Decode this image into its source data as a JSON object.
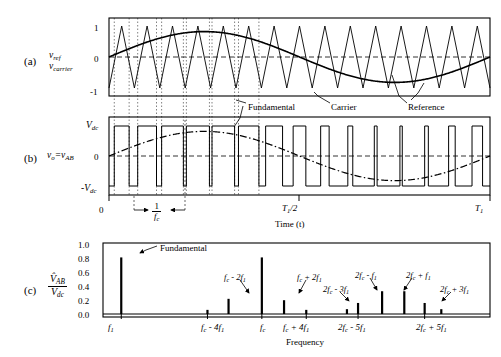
{
  "figure": {
    "panels": [
      "(a)",
      "(b)",
      "(c)"
    ]
  },
  "panel_a": {
    "tag": "(a)",
    "ylabel_line1": "v",
    "ylabel_line1_sub": "ref",
    "ylabel_line2": "v",
    "ylabel_line2_sub": "carrier",
    "yticks": [
      "1",
      "0",
      "-1"
    ],
    "annotations": [
      {
        "name": "carrier",
        "label": "Carrier"
      },
      {
        "name": "reference",
        "label": "Reference"
      }
    ]
  },
  "panel_b": {
    "tag": "(b)",
    "ylabel": "v",
    "ylabel_sub": "o",
    "ylabel_eq": "=v",
    "ylabel_eq_sub": "AB",
    "yticks": [
      "V",
      "0",
      "-V"
    ],
    "ytick_top": "V",
    "ytick_top_sub": "dc",
    "ytick_mid": "0",
    "ytick_bot": "-V",
    "ytick_bot_sub": "dc",
    "xticks": [
      {
        "label": "0",
        "italic": false
      },
      {
        "label": "T",
        "sub": "1",
        "suffix": "/2",
        "italic": true
      },
      {
        "label": "T",
        "sub": "1",
        "suffix": "",
        "italic": true
      }
    ],
    "xlabel": "Time  (t)",
    "period_marker_num": "1",
    "period_marker_den": "f",
    "period_marker_den_sub": "c",
    "annotations": [
      {
        "name": "fundamental",
        "label": "Fundamental"
      }
    ]
  },
  "panel_c": {
    "tag": "(c)",
    "ylabel_num": "V",
    "ylabel_num_sub": "AB",
    "ylabel_num_hat": "^",
    "ylabel_den": "V",
    "ylabel_den_sub": "dc",
    "yticks": [
      "1.0",
      "0.8",
      "0.6",
      "0.4",
      "0.2",
      "0.0"
    ],
    "xlabel": "Frequency",
    "annotation_fundamental": "Fundamental"
  },
  "chart_data": {
    "type": "bar",
    "ylabel": "V_AB_hat / V_dc",
    "xlabel": "Frequency",
    "ylim": [
      0.0,
      1.0
    ],
    "yticks": [
      0.0,
      0.2,
      0.4,
      0.6,
      0.8,
      1.0
    ],
    "grid": false,
    "legend": "none",
    "categories": [
      "f1",
      "fc - 4f1",
      "fc - 2f1",
      "fc",
      "fc + 2f1",
      "fc + 4f1",
      "2fc - 5f1",
      "2fc - 3f1",
      "2fc - f1",
      "2fc + f1",
      "2fc + 3f1",
      "2fc + 5f1"
    ],
    "category_labels": [
      "f₁",
      "fᶜ - 4f₁",
      "fᶜ - 2f₁",
      "fᶜ",
      "fᶜ + 2f₁",
      "fᶜ + 4f₁",
      "2fᶜ - 5f₁",
      "2fᶜ - 3f₁",
      "2fᶜ - f₁",
      "2fᶜ + f₁",
      "2fᶜ + 3f₁",
      "2fᶜ + 5f₁"
    ],
    "values": [
      0.82,
      0.06,
      0.22,
      0.82,
      0.2,
      0.06,
      0.07,
      0.16,
      0.33,
      0.33,
      0.16,
      0.07
    ],
    "x_axis_tick_labels": [
      {
        "text": "f",
        "sub": "1",
        "pos": 0.0
      },
      {
        "text": "f",
        "sub": "c",
        "prefix": "",
        "suffix": " - 4f",
        "sub2": "1",
        "pos": 0.44
      },
      {
        "text": "f",
        "sub": "c",
        "pos": 0.55
      },
      {
        "text": "f",
        "sub": "c",
        "suffix": " + 4f",
        "sub2": "1",
        "pos": 0.66
      },
      {
        "text": "2f",
        "sub": "c",
        "suffix": " - 5f",
        "sub2": "1",
        "pos": 0.775
      },
      {
        "text": "2f",
        "sub": "c",
        "suffix": " + 5f",
        "sub2": "1",
        "pos": 0.93
      }
    ],
    "bar_annotations": [
      {
        "target": "f1",
        "label": "Fundamental"
      },
      {
        "target": "fc - 2f1",
        "label": "fᶜ - 2f₁"
      },
      {
        "target": "fc + 2f1",
        "label": "fᶜ + 2f₁"
      },
      {
        "target": "2fc - 3f1",
        "label": "2fᶜ - 3f₁"
      },
      {
        "target": "2fc - f1",
        "label": "2fᶜ - f₁"
      },
      {
        "target": "2fc + f1",
        "label": "2fᶜ + f₁"
      },
      {
        "target": "2fc + 3f1",
        "label": "2fᶜ + 3f₁"
      }
    ]
  },
  "waveform_data": {
    "carrier": {
      "type": "triangular",
      "cycles_per_fundamental": 15,
      "amplitude": 1.0
    },
    "reference": {
      "type": "sine",
      "cycles": 1,
      "amplitude": 0.82
    },
    "output": {
      "type": "bipolar_pwm",
      "levels": [
        "+Vdc",
        "-Vdc"
      ]
    }
  }
}
